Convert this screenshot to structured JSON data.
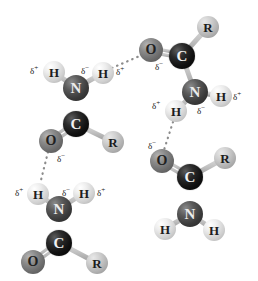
{
  "figure": {
    "width": 258,
    "height": 281,
    "background_color": "#ffffff",
    "type": "molecular-structure-diagram"
  },
  "palette": {
    "carbon": "#111111",
    "nitrogen": "#3a3a3a",
    "oxygen": "#6a6a6a",
    "hydrogen": "#ededed",
    "r_group": "#bdbdbd",
    "bond": "#b9b9b9",
    "hbond_dot": "#8c8c8c",
    "label_text": "#141414"
  },
  "atom_labels": {
    "carbon": "C",
    "nitrogen": "N",
    "oxygen": "O",
    "hydrogen": "H",
    "r_group": "R"
  },
  "charge_symbols": {
    "partial_negative": "δ",
    "partial_negative_sign": "−",
    "partial_positive": "δ",
    "partial_positive_sign": "+"
  },
  "molecules": [
    {
      "id": "upper-left-amide",
      "atoms": [
        {
          "id": "ul-h-left",
          "element": "H",
          "label": "H",
          "x": 54,
          "y": 72,
          "r": 11
        },
        {
          "id": "ul-n",
          "element": "N",
          "label": "N",
          "x": 76,
          "y": 88,
          "r": 13
        },
        {
          "id": "ul-h-right",
          "element": "H",
          "label": "H",
          "x": 103,
          "y": 73,
          "r": 11
        },
        {
          "id": "ul-c",
          "element": "C",
          "label": "C",
          "x": 76,
          "y": 124,
          "r": 13
        },
        {
          "id": "ul-o",
          "element": "O",
          "label": "O",
          "x": 51,
          "y": 141,
          "r": 12
        },
        {
          "id": "ul-r",
          "element": "R",
          "label": "R",
          "x": 113,
          "y": 142,
          "r": 11
        }
      ],
      "bonds": [
        {
          "from": "ul-h-left",
          "to": "ul-n",
          "order": 1
        },
        {
          "from": "ul-h-right",
          "to": "ul-n",
          "order": 1
        },
        {
          "from": "ul-n",
          "to": "ul-c",
          "order": 1
        },
        {
          "from": "ul-c",
          "to": "ul-o",
          "order": 2
        },
        {
          "from": "ul-c",
          "to": "ul-r",
          "order": 1
        }
      ]
    },
    {
      "id": "upper-right-amide",
      "atoms": [
        {
          "id": "ur-r",
          "element": "R",
          "label": "R",
          "x": 208,
          "y": 27,
          "r": 11
        },
        {
          "id": "ur-c",
          "element": "C",
          "label": "C",
          "x": 182,
          "y": 56,
          "r": 13
        },
        {
          "id": "ur-o",
          "element": "O",
          "label": "O",
          "x": 151,
          "y": 50,
          "r": 12
        },
        {
          "id": "ur-n",
          "element": "N",
          "label": "N",
          "x": 195,
          "y": 92,
          "r": 13
        },
        {
          "id": "ur-h-right",
          "element": "H",
          "label": "H",
          "x": 221,
          "y": 96,
          "r": 11
        },
        {
          "id": "ur-h-left",
          "element": "H",
          "label": "H",
          "x": 176,
          "y": 111,
          "r": 11
        }
      ],
      "bonds": [
        {
          "from": "ur-c",
          "to": "ur-r",
          "order": 1
        },
        {
          "from": "ur-c",
          "to": "ur-o",
          "order": 2
        },
        {
          "from": "ur-c",
          "to": "ur-n",
          "order": 1
        },
        {
          "from": "ur-n",
          "to": "ur-h-right",
          "order": 1
        },
        {
          "from": "ur-n",
          "to": "ur-h-left",
          "order": 1
        }
      ]
    },
    {
      "id": "lower-left-amide",
      "atoms": [
        {
          "id": "ll-h-left",
          "element": "H",
          "label": "H",
          "x": 38,
          "y": 194,
          "r": 11
        },
        {
          "id": "ll-n",
          "element": "N",
          "label": "N",
          "x": 59,
          "y": 209,
          "r": 13
        },
        {
          "id": "ll-h-right",
          "element": "H",
          "label": "H",
          "x": 84,
          "y": 193,
          "r": 11
        },
        {
          "id": "ll-c",
          "element": "C",
          "label": "C",
          "x": 59,
          "y": 243,
          "r": 13
        },
        {
          "id": "ll-o",
          "element": "O",
          "label": "O",
          "x": 33,
          "y": 262,
          "r": 12
        },
        {
          "id": "ll-r",
          "element": "R",
          "label": "R",
          "x": 97,
          "y": 263,
          "r": 11
        }
      ],
      "bonds": [
        {
          "from": "ll-h-left",
          "to": "ll-n",
          "order": 1
        },
        {
          "from": "ll-h-right",
          "to": "ll-n",
          "order": 1
        },
        {
          "from": "ll-n",
          "to": "ll-c",
          "order": 1
        },
        {
          "from": "ll-c",
          "to": "ll-o",
          "order": 2
        },
        {
          "from": "ll-c",
          "to": "ll-r",
          "order": 1
        }
      ]
    },
    {
      "id": "lower-right-amide",
      "atoms": [
        {
          "id": "lr-o",
          "element": "O",
          "label": "O",
          "x": 162,
          "y": 161,
          "r": 12
        },
        {
          "id": "lr-c",
          "element": "C",
          "label": "C",
          "x": 190,
          "y": 177,
          "r": 13
        },
        {
          "id": "lr-r",
          "element": "R",
          "label": "R",
          "x": 225,
          "y": 158,
          "r": 11
        },
        {
          "id": "lr-n",
          "element": "N",
          "label": "N",
          "x": 190,
          "y": 214,
          "r": 13
        },
        {
          "id": "lr-h-left",
          "element": "H",
          "label": "H",
          "x": 165,
          "y": 229,
          "r": 11
        },
        {
          "id": "lr-h-right",
          "element": "H",
          "label": "H",
          "x": 214,
          "y": 230,
          "r": 11
        }
      ],
      "bonds": [
        {
          "from": "lr-c",
          "to": "lr-o",
          "order": 2
        },
        {
          "from": "lr-c",
          "to": "lr-r",
          "order": 1
        },
        {
          "from": "lr-c",
          "to": "lr-n",
          "order": 1
        },
        {
          "from": "lr-n",
          "to": "lr-h-left",
          "order": 1
        },
        {
          "from": "lr-n",
          "to": "lr-h-right",
          "order": 1
        }
      ]
    }
  ],
  "hydrogen_bonds": [
    {
      "id": "hbond-ul-h-to-ur-o",
      "from": "ul-h-right",
      "to": "ur-o",
      "x1": 112,
      "y1": 68,
      "x2": 142,
      "y2": 55
    },
    {
      "id": "hbond-ul-o-to-ll-h",
      "from": "ul-o",
      "to": "ll-h-left",
      "x1": 48,
      "y1": 152,
      "x2": 40,
      "y2": 184
    },
    {
      "id": "hbond-ur-h-to-lr-o",
      "from": "ur-h-left",
      "to": "lr-o",
      "x1": 173,
      "y1": 122,
      "x2": 164,
      "y2": 150
    }
  ],
  "charge_annotations": [
    {
      "id": "chg-ul-h-left",
      "text": "δ+",
      "x": 30,
      "y": 66,
      "for_atom": "ul-h-left"
    },
    {
      "id": "chg-ul-n",
      "text": "δ−",
      "x": 81,
      "y": 66,
      "for_atom": "ul-n"
    },
    {
      "id": "chg-ul-h-right",
      "text": "δ+",
      "x": 116,
      "y": 67,
      "for_atom": "ul-h-right"
    },
    {
      "id": "chg-ul-o",
      "text": "δ−",
      "x": 57,
      "y": 154,
      "for_atom": "ul-o"
    },
    {
      "id": "chg-ur-o",
      "text": "δ−",
      "x": 155,
      "y": 62,
      "for_atom": "ur-o"
    },
    {
      "id": "chg-ur-h-left",
      "text": "δ+",
      "x": 152,
      "y": 101,
      "for_atom": "ur-h-left"
    },
    {
      "id": "chg-ur-n",
      "text": "δ−",
      "x": 197,
      "y": 106,
      "for_atom": "ur-n"
    },
    {
      "id": "chg-ur-h-right",
      "text": "δ+",
      "x": 233,
      "y": 92,
      "for_atom": "ur-h-right"
    },
    {
      "id": "chg-lr-o",
      "text": "δ−",
      "x": 148,
      "y": 141,
      "for_atom": "lr-o"
    },
    {
      "id": "chg-ll-h-left",
      "text": "δ+",
      "x": 15,
      "y": 188,
      "for_atom": "ll-h-left"
    },
    {
      "id": "chg-ll-n",
      "text": "δ−",
      "x": 62,
      "y": 188,
      "for_atom": "ll-n"
    },
    {
      "id": "chg-ll-h-right",
      "text": "δ+",
      "x": 97,
      "y": 188,
      "for_atom": "ll-h-right"
    }
  ]
}
